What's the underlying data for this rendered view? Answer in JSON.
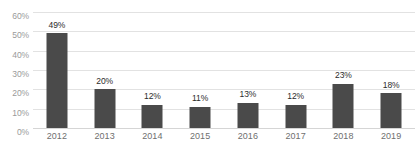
{
  "chart_data": {
    "type": "bar",
    "title": "",
    "xlabel": "",
    "ylabel": "",
    "categories": [
      "2012",
      "2013",
      "2014",
      "2015",
      "2016",
      "2017",
      "2018",
      "2019"
    ],
    "values": [
      49,
      20,
      12,
      11,
      13,
      12,
      23,
      18
    ],
    "value_labels": [
      "49%",
      "20%",
      "12%",
      "11%",
      "13%",
      "12%",
      "23%",
      "18%"
    ],
    "ylim": [
      0,
      60
    ],
    "ytick_values": [
      60,
      50,
      40,
      30,
      20,
      10,
      0
    ],
    "ytick_labels": [
      "60%",
      "50%",
      "40%",
      "30%",
      "20%",
      "10%",
      "0%"
    ],
    "grid": true,
    "legend": "none",
    "bar_color": "#4a4a4a",
    "gridline_color": "#e2e2e2",
    "background_color": "#ffffff",
    "axis_label_color": "#9a9a9a",
    "data_label_color": "#2b2b2b"
  }
}
